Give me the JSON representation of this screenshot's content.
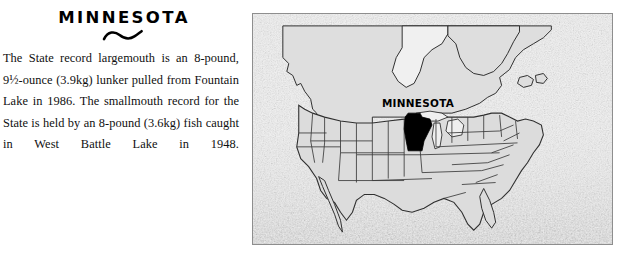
{
  "article": {
    "headline": "MINNESOTA",
    "ornament": "tilde-swash",
    "body": "The State record largemouth is an 8-pound, 9½-ounce (3.9kg) lunker pulled from Fountain Lake in 1986. The smallmouth record for the State is held by an 8-pound (3.6kg) fish caught in West Battle Lake in 1948."
  },
  "map": {
    "label": "MINNESOTA",
    "highlighted_state": "Minnesota",
    "region": "North America",
    "colors": {
      "border": "#8e8e8e",
      "ocean": "#e9e9e9",
      "land": "#dcdcdc",
      "outline": "#3a3a3a",
      "highlight": "#000000",
      "label": "#000000"
    }
  }
}
